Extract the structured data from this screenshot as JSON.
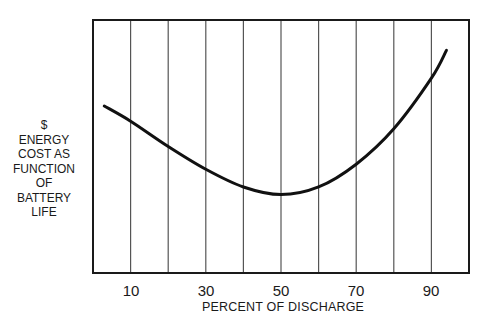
{
  "chart_data": {
    "type": "line",
    "title": "",
    "xlabel": "PERCENT OF DISCHARGE",
    "ylabel": "$ ENERGY COST AS FUNCTION OF BATTERY LIFE",
    "ylabel_lines": [
      "$",
      "ENERGY",
      "COST AS",
      "FUNCTION",
      "OF",
      "BATTERY",
      "LIFE"
    ],
    "xlim": [
      0,
      100
    ],
    "ylim": [
      0,
      100
    ],
    "x_ticks": [
      10,
      30,
      50,
      70,
      90
    ],
    "x_tick_labels": [
      "10",
      "30",
      "50",
      "70",
      "90"
    ],
    "grid": {
      "vertical_lines_at": [
        10,
        20,
        30,
        40,
        50,
        60,
        70,
        80,
        90
      ],
      "horizontal": false
    },
    "y_ticks": [],
    "legend": null,
    "series": [
      {
        "name": "Energy cost vs depth of discharge",
        "x": [
          3,
          10,
          20,
          30,
          40,
          50,
          60,
          70,
          80,
          90,
          94
        ],
        "values": [
          66,
          60,
          50,
          41,
          34,
          31,
          34,
          43,
          57,
          77,
          88
        ]
      }
    ],
    "annotations": [
      "minimum near 50% discharge"
    ]
  }
}
